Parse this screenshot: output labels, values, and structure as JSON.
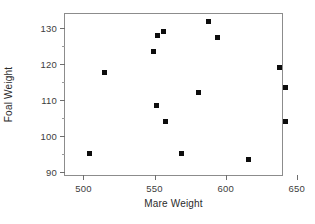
{
  "chart_data": {
    "type": "scatter",
    "title": "",
    "xlabel": "Mare Weight",
    "ylabel": "Foal Weight",
    "xlim": [
      487,
      641
    ],
    "ylim": [
      88.5,
      134
    ],
    "xticks": [
      500,
      550,
      600,
      650
    ],
    "yticks": [
      90,
      100,
      110,
      120,
      130
    ],
    "xtick_labels": [
      "500",
      "550",
      "600",
      "650"
    ],
    "ytick_labels": [
      "90",
      "100",
      "110",
      "120",
      "130"
    ],
    "grid": false,
    "legend": null,
    "marker": "square",
    "marker_color": "#0d0d0d",
    "frame_color": "#8c8c8c",
    "points": [
      {
        "x": 504,
        "y": 95.0
      },
      {
        "x": 515,
        "y": 117.6
      },
      {
        "x": 549,
        "y": 123.5
      },
      {
        "x": 551,
        "y": 108.5
      },
      {
        "x": 552,
        "y": 128.0
      },
      {
        "x": 556,
        "y": 129.0
      },
      {
        "x": 558,
        "y": 104.0
      },
      {
        "x": 569,
        "y": 95.0
      },
      {
        "x": 581,
        "y": 112.0
      },
      {
        "x": 588,
        "y": 132.0
      },
      {
        "x": 594,
        "y": 127.5
      },
      {
        "x": 616,
        "y": 93.5
      },
      {
        "x": 638,
        "y": 119.0
      },
      {
        "x": 642,
        "y": 113.5
      },
      {
        "x": 642,
        "y": 104.0
      }
    ]
  }
}
